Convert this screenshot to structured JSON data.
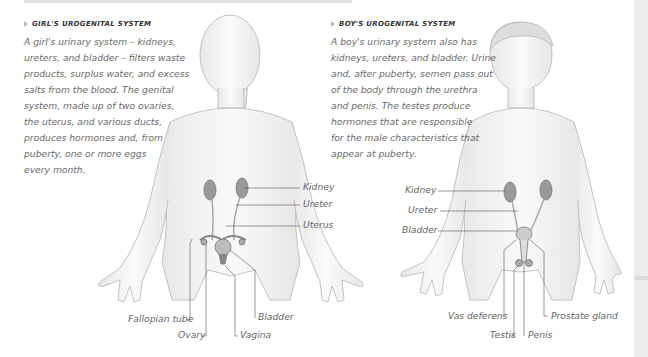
{
  "girl": {
    "heading": "GIRL'S UROGENITAL SYSTEM",
    "lines": [
      "A girl's urinary system – kidneys,",
      "ureters, and bladder – filters waste",
      "products, surplus water, and excess",
      "salts from the blood. The genital",
      "system, made up of two ovaries,",
      "the uterus, and various ducts,",
      "produces hormones and, from",
      "puberty, one or more eggs",
      "every month."
    ],
    "labels": {
      "kidney": "Kidney",
      "ureter": "Ureter",
      "uterus": "Uterus",
      "fallopian_tube": "Fallopian tube",
      "ovary": "Ovary",
      "vagina": "Vagina",
      "bladder": "Bladder"
    }
  },
  "boy": {
    "heading": "BOY'S UROGENITAL SYSTEM",
    "lines": [
      "A boy's urinary system also has",
      "kidneys, ureters, and bladder. Urine",
      "and, after puberty, semen pass out",
      "of the body through the urethra",
      "and penis. The testes produce",
      "hormones that are responsible",
      "for the male characteristics that",
      "appear at puberty."
    ],
    "labels": {
      "kidney": "Kidney",
      "ureter": "Ureter",
      "bladder": "Bladder",
      "vas_deferens": "Vas deferens",
      "testis": "Testis",
      "penis": "Penis",
      "prostate_gland": "Prostate gland"
    }
  }
}
